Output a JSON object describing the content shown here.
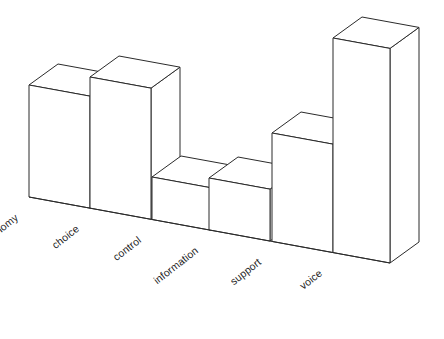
{
  "chart_data": {
    "type": "bar",
    "title": "",
    "subtitle": "",
    "xlabel": "",
    "ylabel": "",
    "categories": [
      "autonomy",
      "choice",
      "control",
      "information",
      "support",
      "voice"
    ],
    "values": [
      112,
      120,
      20,
      19,
      64,
      159
    ],
    "ylim": [
      0,
      170
    ],
    "grid": false,
    "legend": null,
    "annotations": [],
    "style": {
      "render": "3d-isometric",
      "bar_fill": "#ffffff",
      "bar_stroke": "#2b2b2b",
      "background": "#ffffff",
      "axis_line": "#2b2b2b",
      "label_rotation_deg": -38
    },
    "geometry": {
      "baseline_start_x": 29,
      "baseline_start_y": 197,
      "baseline_end_x": 390,
      "baseline_end_y": 263,
      "bar_width_px": 61,
      "depth_dx": 29,
      "depth_dy": -21,
      "front_top_y": [
        85,
        77,
        177,
        178,
        133,
        38
      ],
      "front_left_x": [
        29,
        90,
        152,
        209,
        272,
        333
      ]
    }
  },
  "axis": {
    "tick_labels": [
      "autonomy",
      "choice",
      "control",
      "information",
      "support",
      "voice"
    ]
  }
}
